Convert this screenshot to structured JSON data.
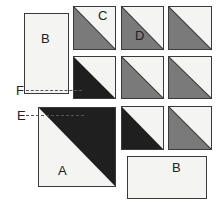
{
  "diagram": {
    "type": "quilt-piece-layout",
    "colors": {
      "light": "#f4f4f2",
      "medium": "#7a7a7a",
      "dark": "#1f1f1f",
      "outline": "#3a3a3a"
    },
    "labels": {
      "B_top": "B",
      "C": "C",
      "D": "D",
      "F": "F",
      "E": "E",
      "A": "A",
      "B_bottom": "B"
    },
    "pieces": [
      {
        "id": "rect-b-top",
        "kind": "rectangle",
        "label": "B"
      },
      {
        "id": "hst-c",
        "kind": "half-square-triangle",
        "fill": "medium",
        "label": "C"
      },
      {
        "id": "hst-d",
        "kind": "half-square-triangle",
        "fill": "medium",
        "label": "D"
      },
      {
        "id": "hst-r1c3",
        "kind": "half-square-triangle",
        "fill": "medium"
      },
      {
        "id": "hst-r2c1",
        "kind": "half-square-triangle",
        "fill": "dark"
      },
      {
        "id": "hst-r2c2",
        "kind": "half-square-triangle",
        "fill": "medium"
      },
      {
        "id": "hst-r2c3",
        "kind": "half-square-triangle",
        "fill": "medium"
      },
      {
        "id": "hst-large-a",
        "kind": "half-square-triangle",
        "fill": "dark",
        "label": "A"
      },
      {
        "id": "hst-r3c2",
        "kind": "half-square-triangle",
        "fill": "dark"
      },
      {
        "id": "hst-r3c3",
        "kind": "half-square-triangle",
        "fill": "medium"
      },
      {
        "id": "rect-b-bottom",
        "kind": "rectangle",
        "label": "B"
      }
    ],
    "guides": [
      {
        "label": "F",
        "style": "dashed"
      },
      {
        "label": "E",
        "style": "dashed"
      }
    ]
  }
}
